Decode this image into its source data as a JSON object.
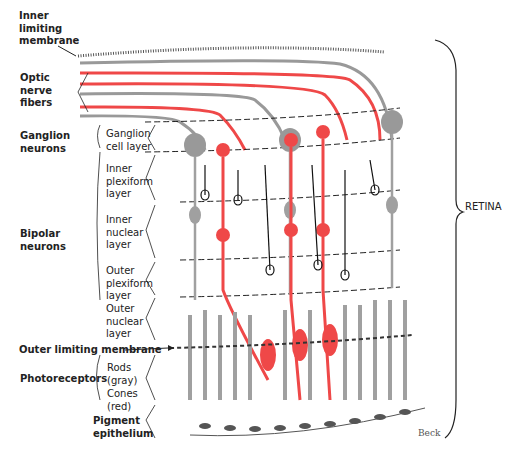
{
  "diagram": {
    "left_labels": {
      "inner_limiting_membrane": [
        "Inner",
        "limiting",
        "membrane"
      ],
      "optic_nerve_fibers": [
        "Optic",
        "nerve",
        "fibers"
      ],
      "ganglion_neurons": [
        "Ganglion",
        "neurons"
      ],
      "bipolar_neurons": [
        "Bipolar",
        "neurons"
      ],
      "outer_limiting_membrane": "Outer limiting membrane",
      "photoreceptors": "Photoreceptors",
      "pigment_epithelium": [
        "Pigment",
        "epithelium"
      ]
    },
    "layer_labels": {
      "ganglion_cell_layer": [
        "Ganglion",
        "cell layer"
      ],
      "inner_plexiform_layer": [
        "Inner",
        "plexiform",
        "layer"
      ],
      "inner_nuclear_layer": [
        "Inner",
        "nuclear",
        "layer"
      ],
      "outer_plexiform_layer": [
        "Outer",
        "plexiform",
        "layer"
      ],
      "outer_nuclear_layer": [
        "Outer",
        "nuclear",
        "layer"
      ],
      "rods": [
        "Rods",
        "(gray)"
      ],
      "cones": [
        "Cones",
        "(red)"
      ]
    },
    "right_label": "RETINA",
    "signature": "Beck",
    "colors": {
      "cone_red": "#ef4848",
      "rod_gray": "#9a9a9a",
      "ink": "#222222"
    }
  }
}
